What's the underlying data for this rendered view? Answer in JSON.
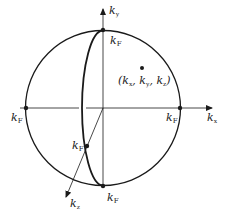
{
  "diagram": {
    "type": "fermi-sphere",
    "colors": {
      "stroke": "#1a1a1a",
      "background": "#ffffff"
    },
    "axes": {
      "kx": {
        "label": "k",
        "subscript": "x"
      },
      "ky": {
        "label": "k",
        "subscript": "y"
      },
      "kz": {
        "label": "k",
        "subscript": "z"
      }
    },
    "points": {
      "top": {
        "label": "k",
        "subscript": "F"
      },
      "bottom": {
        "label": "k",
        "subscript": "F"
      },
      "left": {
        "label": "k",
        "subscript": "F"
      },
      "right": {
        "label": "k",
        "subscript": "F"
      },
      "front": {
        "label": "k",
        "subscript": "F"
      }
    },
    "sample_point": {
      "label": "(k",
      "x_sub": "x",
      "sep1": ", k",
      "y_sub": "y",
      "sep2": ", k",
      "z_sub": "z",
      "close": ")"
    }
  }
}
